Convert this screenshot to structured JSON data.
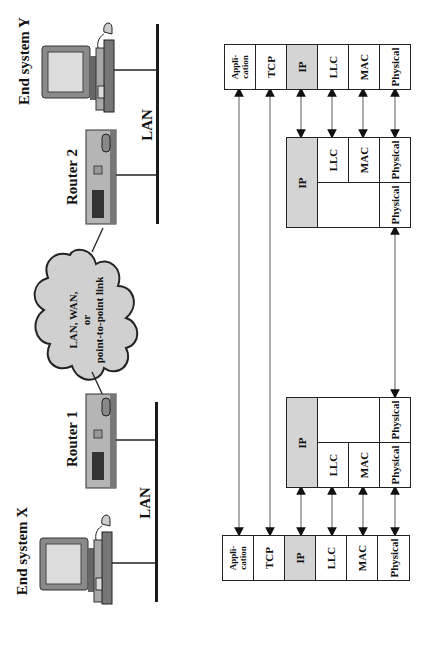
{
  "network": {
    "end_system_y": {
      "label": "End system Y"
    },
    "end_system_x": {
      "label": "End system X"
    },
    "router_1": {
      "label": "Router 1"
    },
    "router_2": {
      "label": "Router 2"
    },
    "lan_top": {
      "label": "LAN"
    },
    "lan_bottom": {
      "label": "LAN"
    },
    "cloud": {
      "line1": "LAN, WAN,",
      "line2": "or",
      "line3": "point-to-point link"
    }
  },
  "stacks": {
    "end_system_y": [
      "Appli-\ncation",
      "TCP",
      "IP",
      "LLC",
      "MAC",
      "Physical"
    ],
    "router_2": {
      "ip": "IP",
      "llc": "LLC",
      "mac": "MAC",
      "physical_a": "Physical",
      "physical_b": "Physical"
    },
    "router_1": {
      "ip": "IP",
      "llc": "LLC",
      "mac": "MAC",
      "physical_a": "Physical",
      "physical_b": "Physical"
    },
    "end_system_x": [
      "Appli-\ncation",
      "TCP",
      "IP",
      "LLC",
      "MAC",
      "Physical"
    ]
  },
  "colors": {
    "shaded_layer": "#d4d4d4",
    "cloud_fill": "#d0d0d0",
    "line": "#222222"
  }
}
